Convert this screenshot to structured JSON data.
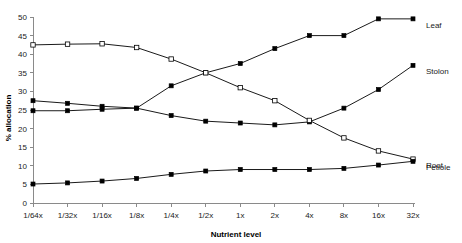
{
  "chart_data": {
    "type": "line",
    "title": "",
    "xlabel": "Nutrient level",
    "ylabel": "% allocation",
    "categories": [
      "1/64x",
      "1/32x",
      "1/16x",
      "1/8x",
      "1/4x",
      "1/2x",
      "1x",
      "2x",
      "4x",
      "8x",
      "16x",
      "32x"
    ],
    "ylim": [
      0,
      50
    ],
    "yticks": [
      0,
      5,
      10,
      15,
      20,
      25,
      30,
      35,
      40,
      45,
      50
    ],
    "grid": false,
    "legend_position": "right-inline-labels",
    "series": [
      {
        "name": "Leaf",
        "marker": "filled-square",
        "label": "Leaf",
        "values": [
          27.5,
          26.8,
          26.0,
          25.5,
          31.5,
          35.0,
          37.5,
          41.5,
          45.0,
          45.0,
          49.5,
          49.5
        ]
      },
      {
        "name": "Stolon",
        "marker": "filled-square",
        "label": "Stolon",
        "values": [
          24.8,
          24.8,
          25.2,
          25.5,
          23.5,
          22.0,
          21.5,
          21.0,
          21.8,
          25.5,
          30.5,
          37.0
        ]
      },
      {
        "name": "Root",
        "marker": "open-square",
        "label": "Root",
        "values": [
          42.5,
          42.7,
          42.8,
          41.8,
          38.7,
          35.0,
          31.0,
          27.5,
          22.2,
          17.5,
          14.0,
          11.8
        ]
      },
      {
        "name": "Petiole",
        "marker": "filled-square",
        "label": "Petiole",
        "values": [
          5.1,
          5.4,
          5.9,
          6.6,
          7.7,
          8.6,
          9.0,
          9.0,
          9.0,
          9.3,
          10.2,
          11.2
        ]
      }
    ]
  }
}
